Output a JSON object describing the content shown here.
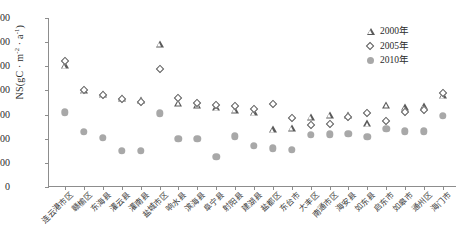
{
  "chart_data": {
    "type": "scatter",
    "title": "",
    "xlabel": "",
    "ylabel": "NS(gC · m-2 · a-1)",
    "ylabel_parts": {
      "prefix": "NS(gC · m",
      "sup1": "-2",
      "mid": " · a",
      "sup2": "-1",
      "suffix": ")"
    },
    "ylim": [
      0,
      700
    ],
    "yticks": [
      0,
      100,
      200,
      300,
      400,
      500,
      600,
      700
    ],
    "grid": false,
    "legend_position": "top-right",
    "categories": [
      "连云港市区",
      "赣榆区",
      "东海县",
      "灌云县",
      "灌南县",
      "盐城市区",
      "响水县",
      "滨海县",
      "阜宁县",
      "射阳县",
      "建湖县",
      "盐都区",
      "东台市",
      "大丰区",
      "南通市区",
      "海安县",
      "如东县",
      "启东市",
      "如皋市",
      "通州区",
      "海门市"
    ],
    "series": [
      {
        "name": "2000年",
        "marker": "triangle",
        "color": "#5a5a5a",
        "values": [
          505,
          400,
          385,
          370,
          360,
          593,
          350,
          340,
          330,
          320,
          310,
          240,
          245,
          290,
          300,
          300,
          265,
          340,
          330,
          335,
          380
        ]
      },
      {
        "name": "2005年",
        "marker": "diamond",
        "color": "#5a5a5a",
        "values": [
          520,
          400,
          382,
          363,
          352,
          490,
          368,
          350,
          340,
          335,
          325,
          345,
          285,
          255,
          260,
          290,
          305,
          275,
          310,
          318,
          390
        ]
      },
      {
        "name": "2010年",
        "marker": "circle",
        "color": "#a8a8a8",
        "values": [
          310,
          228,
          205,
          150,
          150,
          305,
          200,
          200,
          125,
          210,
          170,
          160,
          155,
          215,
          218,
          220,
          207,
          240,
          230,
          230,
          295
        ]
      }
    ]
  },
  "legend": {
    "items": [
      {
        "label": "2000年",
        "icon": "triangle-marker-icon"
      },
      {
        "label": "2005年",
        "icon": "diamond-marker-icon"
      },
      {
        "label": "2010年",
        "icon": "circle-marker-icon"
      }
    ]
  }
}
